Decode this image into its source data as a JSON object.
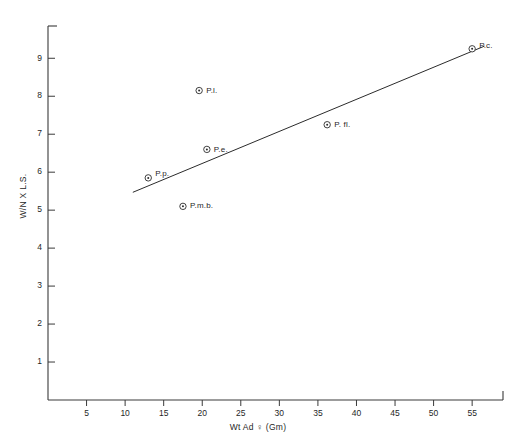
{
  "chart_data": {
    "type": "scatter",
    "title": "",
    "xlabel": "Wt Ad ♀ (Gm)",
    "ylabel": "W/N X L.S.",
    "xlim": [
      0,
      59
    ],
    "ylim": [
      0,
      9.85
    ],
    "grid": false,
    "legend": "none",
    "xticks": [
      5,
      10,
      15,
      20,
      25,
      30,
      35,
      40,
      45,
      50,
      55
    ],
    "xticklabels": [
      "5",
      "10",
      "15",
      "20",
      "25",
      "30",
      "35",
      "40",
      "45",
      "50",
      "55"
    ],
    "yticks": [
      1,
      2,
      3,
      4,
      5,
      6,
      7,
      8,
      9
    ],
    "yticklabels": [
      "1",
      "2",
      "3",
      "4",
      "5",
      "6",
      "7",
      "8",
      "9"
    ],
    "marker_style": "open-circle-with-dot",
    "points": [
      {
        "label": "P.p.",
        "x": 13.0,
        "y": 5.85,
        "label_dx": 7,
        "label_dy": -4
      },
      {
        "label": "P.m.b.",
        "x": 17.5,
        "y": 5.1,
        "label_dx": 7,
        "label_dy": 0
      },
      {
        "label": "P.e.",
        "x": 20.6,
        "y": 6.6,
        "label_dx": 7,
        "label_dy": 0
      },
      {
        "label": "P.l.",
        "x": 19.6,
        "y": 8.15,
        "label_dx": 7,
        "label_dy": 0
      },
      {
        "label": "P. fl.",
        "x": 36.2,
        "y": 7.25,
        "label_dx": 7,
        "label_dy": 0
      },
      {
        "label": "P.c.",
        "x": 55.0,
        "y": 9.25,
        "label_dx": 7,
        "label_dy": -3
      }
    ],
    "series": [
      {
        "name": "regression-line",
        "type": "line",
        "x": [
          11.0,
          56.6
        ],
        "y": [
          5.47,
          9.32
        ]
      }
    ]
  },
  "axes": {
    "x_title": "Wt Ad ♀ (Gm)",
    "y_title": "W/N X L.S."
  }
}
